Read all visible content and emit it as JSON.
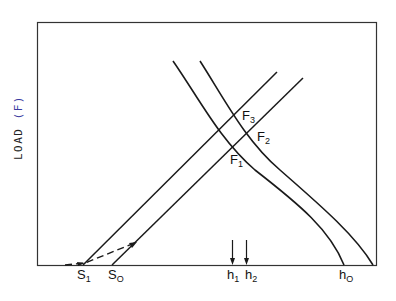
{
  "diagram": {
    "y_axis_label": "LOAD",
    "y_axis_unit": "(F)",
    "x_axis_labels": [
      {
        "id": "s1",
        "base": "S",
        "sub": "1"
      },
      {
        "id": "s0",
        "base": "S",
        "sub": "O"
      },
      {
        "id": "h1",
        "base": "h",
        "sub": "1"
      },
      {
        "id": "h2",
        "base": "h",
        "sub": "2"
      },
      {
        "id": "h0",
        "base": "h",
        "sub": "O"
      }
    ],
    "intersection_labels": [
      {
        "id": "f1",
        "base": "F",
        "sub": "1"
      },
      {
        "id": "f2",
        "base": "F",
        "sub": "2"
      },
      {
        "id": "f3",
        "base": "F",
        "sub": "3"
      }
    ],
    "colors": {
      "line": "#1a1a1a",
      "frame": "#333333",
      "accent_paren": "#3a3aa0"
    }
  }
}
